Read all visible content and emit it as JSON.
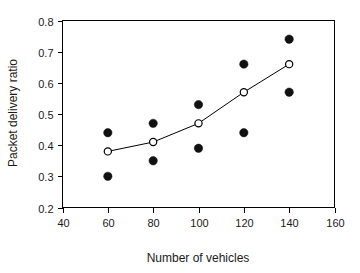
{
  "chart_data": {
    "type": "scatter",
    "title": "",
    "xlabel": "Number of vehicles",
    "ylabel": "Packet delivery ratio",
    "xlim": [
      40,
      160
    ],
    "ylim": [
      0.2,
      0.8
    ],
    "xticks": [
      40,
      60,
      80,
      100,
      120,
      140,
      160
    ],
    "xtick_labels": [
      "40",
      "60",
      "80",
      "100",
      "120",
      "140",
      "160"
    ],
    "yticks": [
      0.2,
      0.3,
      0.4,
      0.5,
      0.6,
      0.7,
      0.8
    ],
    "ytick_labels": [
      "0.2",
      "0.3",
      "0.4",
      "0.5",
      "0.6",
      "0.7",
      "0.8"
    ],
    "grid": false,
    "legend": "none",
    "frame": "box",
    "tick_direction": "out",
    "x": [
      60,
      80,
      100,
      120,
      140
    ],
    "series": [
      {
        "name": "open-circles-line",
        "marker": "open-circle",
        "connected": true,
        "color": "#000000",
        "values": [
          0.38,
          0.41,
          0.47,
          0.57,
          0.66
        ]
      },
      {
        "name": "filled-circles-upper",
        "marker": "filled-circle",
        "connected": false,
        "color": "#111111",
        "values": [
          0.44,
          0.47,
          0.53,
          0.66,
          0.74
        ]
      },
      {
        "name": "filled-circles-lower",
        "marker": "filled-circle",
        "connected": false,
        "color": "#111111",
        "values": [
          0.3,
          0.35,
          0.39,
          0.44,
          0.57
        ]
      }
    ]
  }
}
